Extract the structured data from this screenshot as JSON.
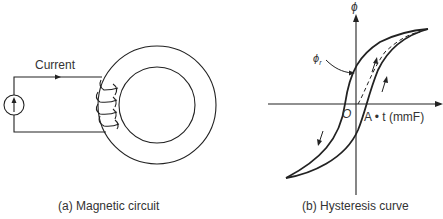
{
  "figure_a": {
    "caption": "(a) Magnetic circuit",
    "current_label": "Current",
    "source_icon": "current-source-icon"
  },
  "figure_b": {
    "caption": "(b) Hysteresis curve",
    "y_axis_label": "ϕ",
    "x_axis_label": "A • t (mmF)",
    "origin_label": "O",
    "remanence_label": "ϕ",
    "remanence_subscript": "r"
  },
  "colors": {
    "stroke": "#222222",
    "background": "#ffffff"
  }
}
